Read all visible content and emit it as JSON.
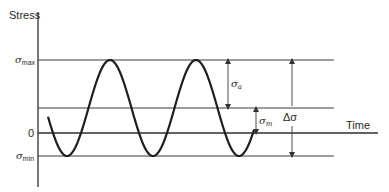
{
  "diagram": {
    "y_axis_label": "Stress",
    "x_axis_label": "Time",
    "levels": {
      "max_label": "σ",
      "max_sub": "max",
      "zero_label": "0",
      "min_label": "σ",
      "min_sub": "min"
    },
    "dimensions": {
      "amplitude_label": "σ",
      "amplitude_sub": "a",
      "mean_label": "σ",
      "mean_sub": "m",
      "range_label": "Δσ"
    },
    "waveform": {
      "type": "sinusoid",
      "cycles_shown": 2.4
    }
  }
}
